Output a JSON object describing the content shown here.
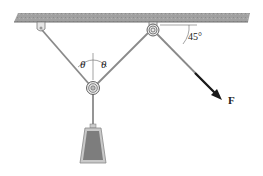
{
  "diagram": {
    "type": "pulley-system",
    "labels": {
      "theta_left": "θ",
      "theta_right": "θ",
      "angle": "45°",
      "force": "F"
    },
    "colors": {
      "ceiling": "#9a9a9a",
      "rope": "#8a8a8a",
      "weight_fill": "#7d7d7d",
      "weight_border": "#a8a8a8",
      "arrow": "#1a1a1a"
    }
  }
}
